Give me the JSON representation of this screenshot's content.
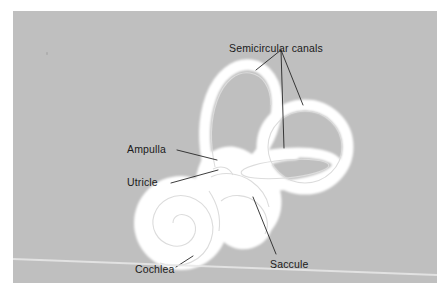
{
  "figure": {
    "plate_background_color": "#bfbfbf",
    "page_background_color": "#ffffff",
    "structure_fill_color": "#ffffff",
    "label_text_color": "#1a1a1a",
    "leader_line_color": "#262626"
  },
  "labels": {
    "semicircular_canals": "Semicircular canals",
    "ampulla": "Ampulla",
    "utricle": "Utricle",
    "cochlea": "Cochlea",
    "saccule": "Saccule"
  },
  "structures": [
    {
      "name": "anterior-semicircular-canal"
    },
    {
      "name": "lateral-semicircular-canal"
    },
    {
      "name": "ampulla"
    },
    {
      "name": "utricle"
    },
    {
      "name": "saccule"
    },
    {
      "name": "cochlea"
    }
  ]
}
